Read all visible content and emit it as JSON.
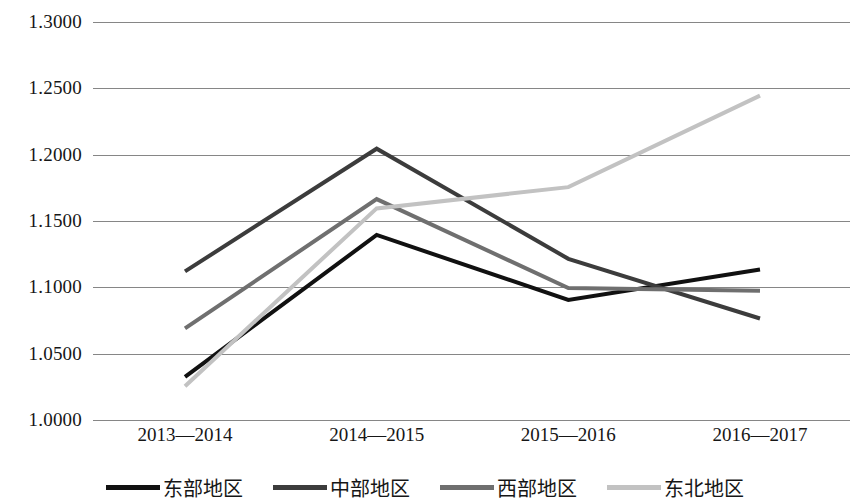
{
  "chart_data": {
    "type": "line",
    "title": "",
    "subtitle": "",
    "xlabel": "",
    "ylabel": "",
    "categories": [
      "2013—2014",
      "2014—2015",
      "2015—2016",
      "2016—2017"
    ],
    "series": [
      {
        "name": "东部地区",
        "color": "#111111",
        "values": [
          1.0325,
          1.1395,
          1.0905,
          1.1135
        ]
      },
      {
        "name": "中部地区",
        "color": "#3c3c3c",
        "values": [
          1.112,
          1.2045,
          1.1215,
          1.0765
        ]
      },
      {
        "name": "西部地区",
        "color": "#6f6f6f",
        "values": [
          1.069,
          1.1665,
          1.0995,
          1.0975
        ]
      },
      {
        "name": "东北地区",
        "color": "#c2c2c2",
        "values": [
          1.0255,
          1.1595,
          1.1755,
          1.2445
        ]
      }
    ],
    "ylim": [
      1.0,
      1.3
    ],
    "yticks": [
      "1.0000",
      "1.0500",
      "1.1000",
      "1.1500",
      "1.2000",
      "1.2500",
      "1.3000"
    ],
    "ytick_values": [
      1.0,
      1.05,
      1.1,
      1.15,
      1.2,
      1.25,
      1.3
    ],
    "grid": true,
    "grid_color": "#868686",
    "legend_position": "bottom",
    "background": "#ffffff"
  }
}
